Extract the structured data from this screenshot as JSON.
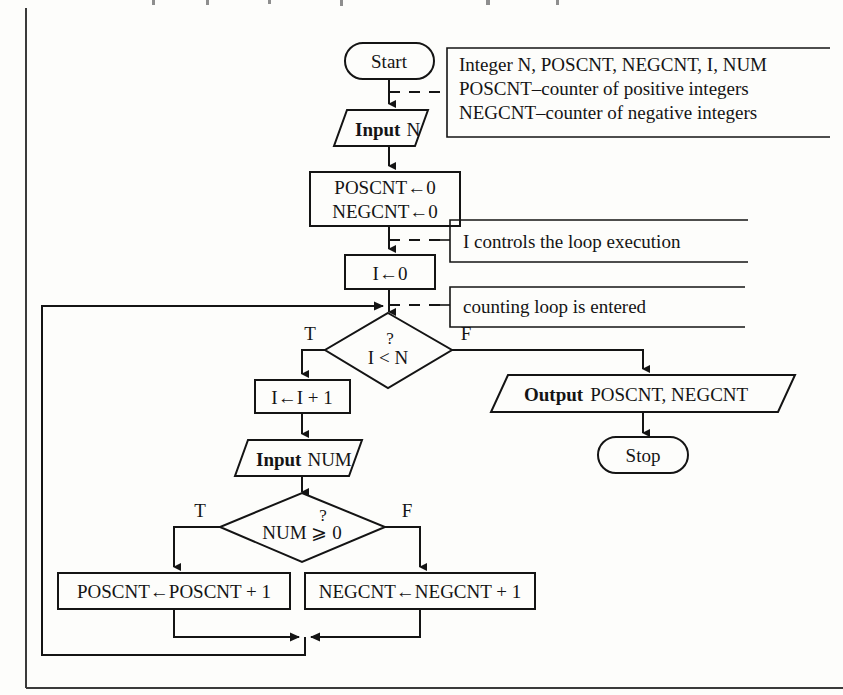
{
  "diagram": {
    "type": "flowchart",
    "nodes": {
      "start": {
        "shape": "terminator",
        "label": "Start"
      },
      "input_n": {
        "shape": "io-parallelogram",
        "label_bold": "Input",
        "label": "N"
      },
      "init_counters": {
        "shape": "process",
        "line1": "POSCNT←0",
        "line2": "NEGCNT←0"
      },
      "init_i": {
        "shape": "process",
        "label": "I←0"
      },
      "decision_loop": {
        "shape": "decision",
        "question_mark": "?",
        "label": "I < N",
        "true_label": "T",
        "false_label": "F"
      },
      "increment_i": {
        "shape": "process",
        "label": "I←I + 1"
      },
      "input_num": {
        "shape": "io-parallelogram",
        "label_bold": "Input",
        "label": "NUM"
      },
      "decision_sign": {
        "shape": "decision",
        "question_mark": "?",
        "label": "NUM ⩾ 0",
        "true_label": "T",
        "false_label": "F"
      },
      "inc_poscnt": {
        "shape": "process",
        "label": "POSCNT←POSCNT + 1"
      },
      "inc_negcnt": {
        "shape": "process",
        "label": "NEGCNT←NEGCNT + 1"
      },
      "output": {
        "shape": "io-parallelogram",
        "label_bold": "Output",
        "label": "POSCNT, NEGCNT"
      },
      "stop": {
        "shape": "terminator",
        "label": "Stop"
      }
    },
    "annotations": {
      "declarations": {
        "line1": "Integer N, POSCNT, NEGCNT, I, NUM",
        "line2": "POSCNT–counter of positive integers",
        "line3": "NEGCNT–counter of negative integers"
      },
      "loop_control": {
        "line1": "I controls the loop execution"
      },
      "loop_entry": {
        "line1": "counting loop is entered"
      }
    },
    "colors": {
      "ink": "#141414",
      "page": "#fdfdfb",
      "border": "#3a3a3a"
    }
  }
}
